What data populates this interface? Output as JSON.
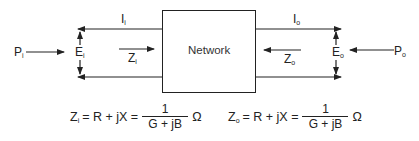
{
  "diagram": {
    "box_label": "Network",
    "input": {
      "power": "P",
      "power_sub": "i",
      "voltage": "E",
      "voltage_sub": "i",
      "current": "I",
      "current_sub": "i",
      "impedance": "Z",
      "impedance_sub": "i"
    },
    "output": {
      "power": "P",
      "power_sub": "o",
      "voltage": "E",
      "voltage_sub": "o",
      "current": "I",
      "current_sub": "o",
      "impedance": "Z",
      "impedance_sub": "o"
    },
    "equations": [
      {
        "lhs": "Z",
        "lhs_sub": "i",
        "middle": "= R + jX =",
        "numerator": "1",
        "denominator": "G + jB",
        "unit": "Ω"
      },
      {
        "lhs": "Z",
        "lhs_sub": "o",
        "middle": "= R + jX =",
        "numerator": "1",
        "denominator": "G + jB",
        "unit": "Ω"
      }
    ],
    "colors": {
      "line": "#222222",
      "background": "#ffffff"
    }
  }
}
